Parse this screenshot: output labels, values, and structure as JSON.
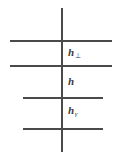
{
  "figure": {
    "name": "layered-interface-diagram",
    "background_color": "#ffffff",
    "line_color": "#4a4a4a",
    "text_color": "#3b3b3b",
    "width": 122,
    "height": 161,
    "vertical_axis": {
      "name": "vertical-line",
      "x": 61,
      "y_top": 8,
      "y_bottom": 152
    },
    "horizontal_lines": [
      {
        "id": "line-1",
        "y": 40,
        "x_start": 10,
        "x_end": 112
      },
      {
        "id": "line-2",
        "y": 65,
        "x_start": 10,
        "x_end": 112
      },
      {
        "id": "line-3",
        "y": 97,
        "x_start": 23,
        "x_end": 103
      },
      {
        "id": "line-4",
        "y": 128,
        "x_start": 23,
        "x_end": 103
      }
    ],
    "labels": [
      {
        "id": "label-h-perp",
        "base": "h",
        "subscript": "⊥",
        "subscript_kind": "symbol",
        "x": 68,
        "y": 47
      },
      {
        "id": "label-h",
        "base": "h",
        "subscript": "",
        "subscript_kind": "none",
        "x": 68,
        "y": 76
      },
      {
        "id": "label-h-gamma",
        "base": "h",
        "subscript": "γ",
        "subscript_kind": "greek",
        "x": 68,
        "y": 105
      }
    ]
  }
}
